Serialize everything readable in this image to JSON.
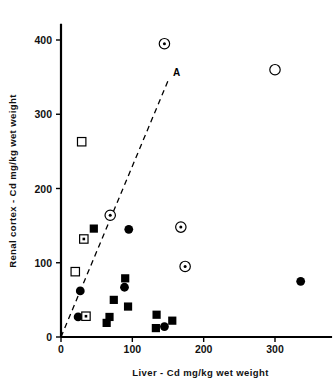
{
  "chart_data": {
    "type": "scatter",
    "title": "",
    "xlabel": "Liver - Cd  mg/kg  wet  weight",
    "ylabel": "Renal cortex - Cd  mg/kg  wet  weight",
    "xlim": [
      0,
      380
    ],
    "ylim": [
      0,
      420
    ],
    "xticks": [
      0,
      100,
      200,
      300
    ],
    "yticks": [
      0,
      100,
      200,
      300,
      400
    ],
    "xtick_labels": [
      "0",
      "100",
      "200",
      "300"
    ],
    "ytick_labels": [
      "0",
      "100",
      "200",
      "300",
      "400"
    ],
    "grid": false,
    "legend_position": "none",
    "annotations": [
      {
        "text": "A",
        "x": 157,
        "y": 352,
        "describes": "dashed reference line"
      }
    ],
    "reference_line": {
      "label": "A",
      "style": "dashed",
      "from": {
        "x": 0,
        "y": 0
      },
      "to": {
        "x": 150,
        "y": 345
      }
    },
    "series": [
      {
        "name": "filled-square",
        "marker": "filled-square",
        "points": [
          {
            "x": 46,
            "y": 146
          },
          {
            "x": 90,
            "y": 79
          },
          {
            "x": 74,
            "y": 50
          },
          {
            "x": 94,
            "y": 41
          },
          {
            "x": 68,
            "y": 27
          },
          {
            "x": 64,
            "y": 19
          },
          {
            "x": 134,
            "y": 30
          },
          {
            "x": 133,
            "y": 12
          },
          {
            "x": 156,
            "y": 22
          }
        ]
      },
      {
        "name": "filled-circle",
        "marker": "filled-circle",
        "points": [
          {
            "x": 95,
            "y": 145
          },
          {
            "x": 89,
            "y": 67
          },
          {
            "x": 27,
            "y": 62
          },
          {
            "x": 24,
            "y": 27
          },
          {
            "x": 145,
            "y": 14
          },
          {
            "x": 336,
            "y": 75
          }
        ]
      },
      {
        "name": "open-square",
        "marker": "open-square",
        "points": [
          {
            "x": 29,
            "y": 263
          },
          {
            "x": 20,
            "y": 88
          }
        ]
      },
      {
        "name": "open-square-dot",
        "marker": "open-square-dot",
        "points": [
          {
            "x": 32,
            "y": 132
          },
          {
            "x": 35,
            "y": 28
          }
        ]
      },
      {
        "name": "open-circle",
        "marker": "open-circle",
        "points": [
          {
            "x": 300,
            "y": 360
          }
        ]
      },
      {
        "name": "open-circle-dot",
        "marker": "open-circle-dot",
        "points": [
          {
            "x": 145,
            "y": 395
          },
          {
            "x": 69,
            "y": 164
          },
          {
            "x": 168,
            "y": 148
          },
          {
            "x": 174,
            "y": 95
          }
        ]
      }
    ]
  }
}
